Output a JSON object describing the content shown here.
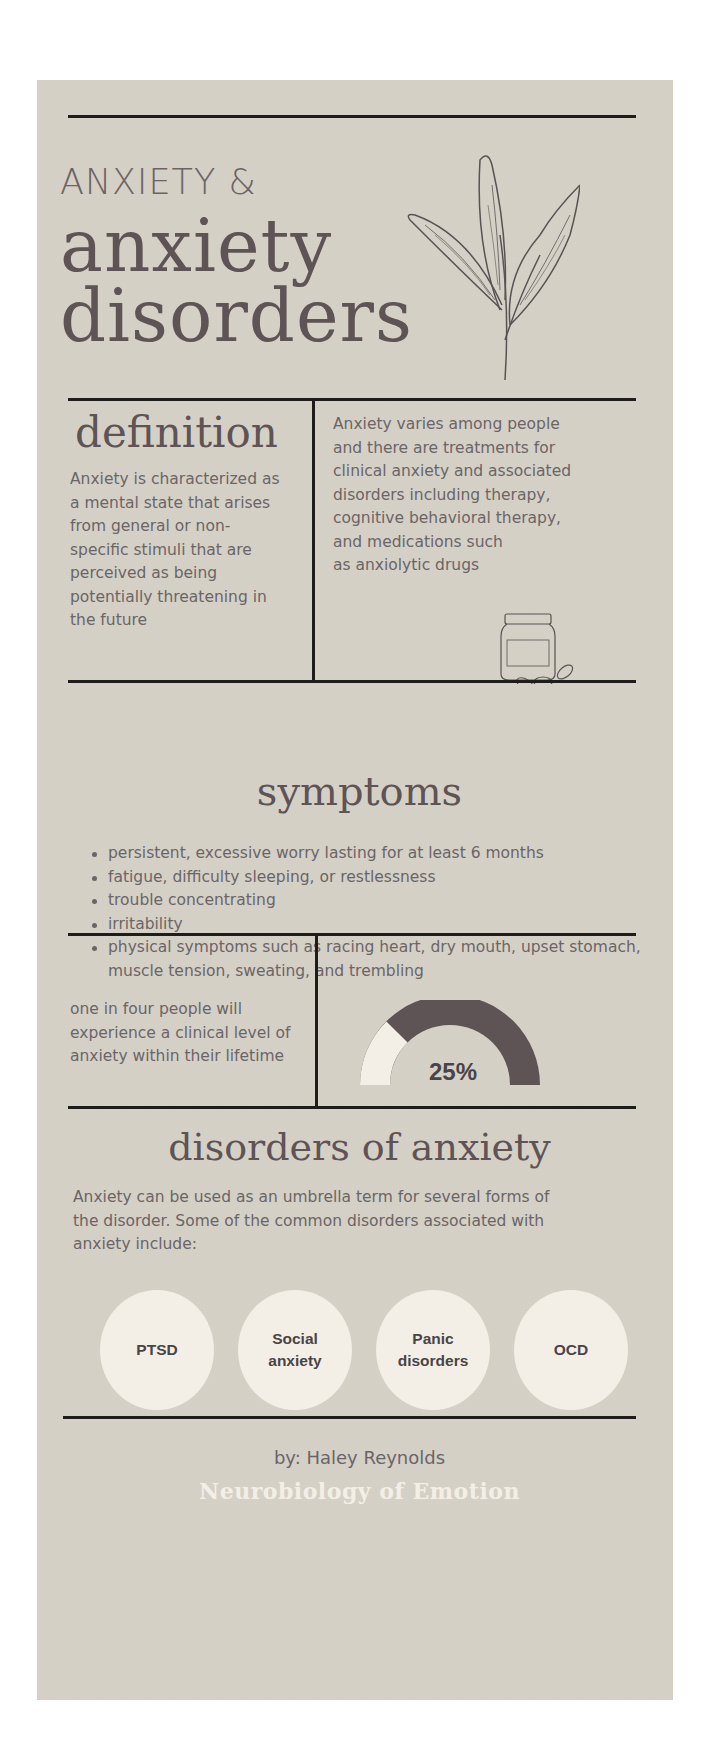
{
  "header": {
    "title_prefix": "ANXIETY &",
    "title_line1": "anxiety",
    "title_line2": "disorders",
    "illustration": "leaf-branch-icon"
  },
  "definition": {
    "heading": "definition",
    "left_text_lines": [
      "Anxiety is characterized as",
      "a mental state that arises",
      "from general or non-",
      "specific stimuli that are",
      "perceived as being",
      "potentially threatening in",
      "the future"
    ],
    "right_text_lines": [
      "Anxiety varies among people",
      "and there are treatments for",
      "clinical anxiety and associated",
      "disorders including therapy,",
      "cognitive behavioral therapy,",
      "and medications such",
      "as anxiolytic drugs"
    ],
    "illustration": "pill-bottle-icon"
  },
  "symptoms": {
    "heading": "symptoms",
    "items": [
      "persistent, excessive worry lasting for at least 6 months",
      "fatigue, difficulty sleeping, or restlessness",
      "trouble concentrating",
      "irritability",
      "physical symptoms such as racing heart, dry mouth, upset stomach, muscle tension, sweating, and trembling"
    ]
  },
  "statistic": {
    "text_lines": [
      "one in four people will",
      "experience a clinical level of",
      "anxiety within their lifetime"
    ],
    "value_label": "25%",
    "value": 25,
    "filled_color": "#f4efe6",
    "remaining_color": "#5e5355"
  },
  "disorders": {
    "heading": "disorders of anxiety",
    "intro_lines": [
      "Anxiety can be used as an umbrella term for several forms of",
      "the disorder. Some of the common disorders associated with",
      "anxiety include:"
    ],
    "items": [
      {
        "line1": "PTSD",
        "line2": ""
      },
      {
        "line1": "Social",
        "line2": "anxiety"
      },
      {
        "line1": "Panic",
        "line2": "disorders"
      },
      {
        "line1": "OCD",
        "line2": ""
      }
    ]
  },
  "footer": {
    "byline": "by: Haley Reynolds",
    "course": "Neurobiology of Emotion"
  },
  "colors": {
    "background": "#d4d0c6",
    "heading": "#5e5355",
    "body": "#6b6567",
    "rule": "#1f1c1c",
    "circle": "#f4efe6"
  }
}
